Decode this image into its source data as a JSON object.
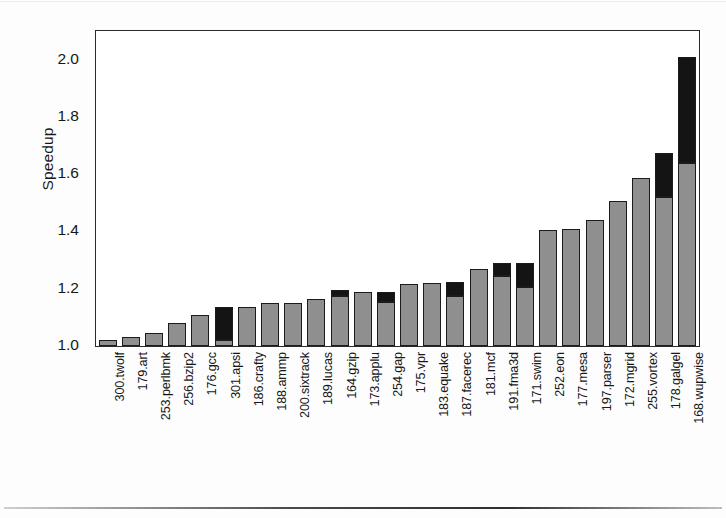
{
  "chart_data": {
    "type": "bar",
    "subtype": "stacked-bar",
    "title": "",
    "xlabel": "",
    "ylabel": "Speedup",
    "ylim": [
      1.0,
      2.1
    ],
    "yticks": [
      "1.0",
      "1.2",
      "1.4",
      "1.6",
      "1.8",
      "2.0"
    ],
    "ytick_values": [
      1.0,
      1.2,
      1.4,
      1.6,
      1.8,
      2.0
    ],
    "grid": false,
    "legend": "none",
    "baseline": 1.0,
    "categories": [
      "300.twolf",
      "179.art",
      "253.perlbmk",
      "256.bzip2",
      "176.gcc",
      "301.apsi",
      "186.crafty",
      "188.ammp",
      "200.sixtrack",
      "189.lucas",
      "164.gzip",
      "173.applu",
      "254.gap",
      "175.vpr",
      "183.equake",
      "187.facerec",
      "181.mcf",
      "191.fma3d",
      "171.swim",
      "252.eon",
      "177.mesa",
      "197.parser",
      "172.mgrid",
      "255.vortex",
      "178.galgel",
      "168.wupwise"
    ],
    "series": [
      {
        "name": "gray-segment",
        "color": "#8f8f8f",
        "values": [
          1.02,
          1.03,
          1.045,
          1.08,
          1.11,
          1.02,
          1.135,
          1.15,
          1.15,
          1.165,
          1.175,
          1.19,
          1.155,
          1.215,
          1.22,
          1.175,
          1.27,
          1.245,
          1.205,
          1.405,
          1.41,
          1.44,
          1.505,
          1.585,
          1.52,
          1.64
        ]
      },
      {
        "name": "black-segment",
        "color": "#141414",
        "values": [
          0.0,
          0.0,
          0.0,
          0.0,
          0.0,
          0.115,
          0.0,
          0.0,
          0.0,
          0.0,
          0.02,
          0.0,
          0.035,
          0.0,
          0.0,
          0.05,
          0.0,
          0.045,
          0.085,
          0.0,
          0.0,
          0.0,
          0.0,
          0.0,
          0.155,
          0.37
        ]
      }
    ],
    "totals": [
      1.02,
      1.03,
      1.045,
      1.08,
      1.11,
      1.135,
      1.135,
      1.15,
      1.15,
      1.165,
      1.195,
      1.19,
      1.19,
      1.215,
      1.22,
      1.225,
      1.27,
      1.29,
      1.29,
      1.405,
      1.41,
      1.44,
      1.505,
      1.585,
      1.675,
      2.01
    ]
  }
}
